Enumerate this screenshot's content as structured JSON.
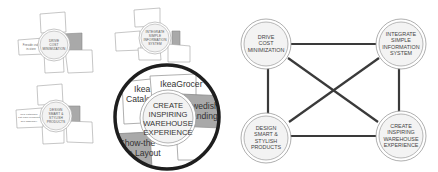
{
  "colors": {
    "background": "#ffffff",
    "line": "#3a3a3a",
    "circle_fill": "#f3f3f3",
    "circle_stroke": "#9a9a9a",
    "petal_fill": "#ffffff",
    "petal_stroke": "#a0a0a0",
    "petal_accent_fill": "#a9a9a9",
    "magnifier_ring": "#1e1e1e"
  },
  "small_diagrams": [
    {
      "id": "drive",
      "lines": [
        "DRIVE",
        "COST",
        "MINIMIZATION"
      ],
      "side_label_lines": [
        "Fireside craft",
        "in-store"
      ]
    },
    {
      "id": "integrate",
      "lines": [
        "INTEGRATE",
        "SIMPLE",
        "INFORMATION",
        "SYSTEM"
      ]
    },
    {
      "id": "design",
      "lines": [
        "DESIGN",
        "SMART &",
        "STYLISH",
        "PRODUCTS"
      ],
      "side_label_lines": [
        "Ikea catalogue",
        "flat-pack products",
        "self-assembly"
      ]
    }
  ],
  "magnified": {
    "center_lines": [
      "CREATE",
      "INSPIRING",
      "WAREHOUSE",
      "EXPERIENCE"
    ],
    "petals": [
      {
        "id": "catalog",
        "lines": [
          "Ikea",
          "Catalog"
        ]
      },
      {
        "id": "grocer",
        "lines": [
          "IkeaGrocer"
        ]
      },
      {
        "id": "branding",
        "lines": [
          "Swedish",
          "Branding"
        ],
        "visible_lines": [
          "wedish",
          "anding"
        ]
      },
      {
        "id": "layout",
        "lines": [
          "Show-the",
          "Store Layout"
        ],
        "visible_lines": [
          "Show-the",
          "Store Layout"
        ]
      }
    ]
  },
  "network": {
    "nodes": [
      {
        "id": "drive",
        "lines": [
          "DRIVE",
          "COST",
          "MINIMIZATION"
        ]
      },
      {
        "id": "integrate",
        "lines": [
          "INTEGRATE",
          "SIMPLE",
          "INFORMATION",
          "SYSTEM"
        ]
      },
      {
        "id": "design",
        "lines": [
          "DESIGN",
          "SMART &",
          "STYLISH",
          "PRODUCTS"
        ]
      },
      {
        "id": "create",
        "lines": [
          "CREATE",
          "INSPIRING",
          "WAREHOUSE",
          "EXPERIENCE"
        ]
      }
    ],
    "edges": [
      [
        "drive",
        "integrate"
      ],
      [
        "drive",
        "design"
      ],
      [
        "integrate",
        "create"
      ],
      [
        "design",
        "create"
      ],
      [
        "drive",
        "create"
      ],
      [
        "integrate",
        "design"
      ]
    ]
  }
}
